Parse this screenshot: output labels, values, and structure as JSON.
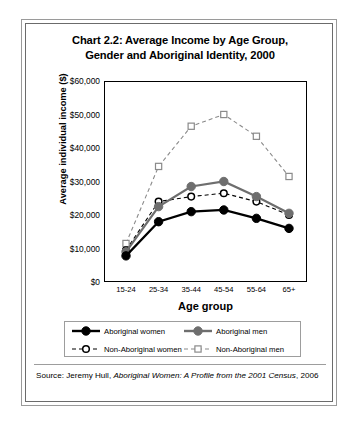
{
  "chart_data": {
    "type": "line",
    "title": "Chart 2.2:  Average Income by Age Group, Gender and Aboriginal Identity, 2000",
    "title_line1": "Chart 2.2:  Average Income by Age Group,",
    "title_line2": "Gender and Aboriginal Identity, 2000",
    "xlabel": "Age group",
    "ylabel": "Average individual income ($)",
    "categories": [
      "15-24",
      "25-34",
      "35-44",
      "45-54",
      "55-64",
      "65+"
    ],
    "ylim": [
      0,
      60000
    ],
    "yticks": [
      0,
      10000,
      20000,
      30000,
      40000,
      50000,
      60000
    ],
    "ytick_labels": [
      "$0",
      "$10,000",
      "$20,000",
      "$30,000",
      "$40,000",
      "$50,000",
      "$60,000"
    ],
    "grid": false,
    "legend_position": "bottom",
    "series": [
      {
        "name": "Aboriginal women",
        "values": [
          7800,
          18000,
          21000,
          21500,
          19000,
          16000
        ],
        "color": "#000000",
        "line_style": "solid",
        "marker": "filled-circle"
      },
      {
        "name": "Aboriginal men",
        "values": [
          9000,
          22500,
          28500,
          30000,
          25500,
          20500
        ],
        "color": "#6e6e6e",
        "line_style": "solid",
        "marker": "filled-circle"
      },
      {
        "name": "Non-Aboriginal women",
        "values": [
          9500,
          24000,
          25500,
          26500,
          24000,
          20000
        ],
        "color": "#000000",
        "line_style": "dashed",
        "marker": "hollow-circle"
      },
      {
        "name": "Non-Aboriginal men",
        "values": [
          11500,
          34500,
          46500,
          50000,
          43500,
          31500
        ],
        "color": "#8a8a8a",
        "line_style": "dashed",
        "marker": "hollow-square"
      }
    ]
  },
  "legend": {
    "entries": [
      "Aboriginal women",
      "Aboriginal men",
      "Non-Aboriginal women",
      "Non-Aboriginal men"
    ]
  },
  "source": {
    "label": "Source:",
    "author": "Jeremy Hull,",
    "title_italic": "Aboriginal Women: A Profile from the 2001 Census",
    "year": ", 2006"
  }
}
